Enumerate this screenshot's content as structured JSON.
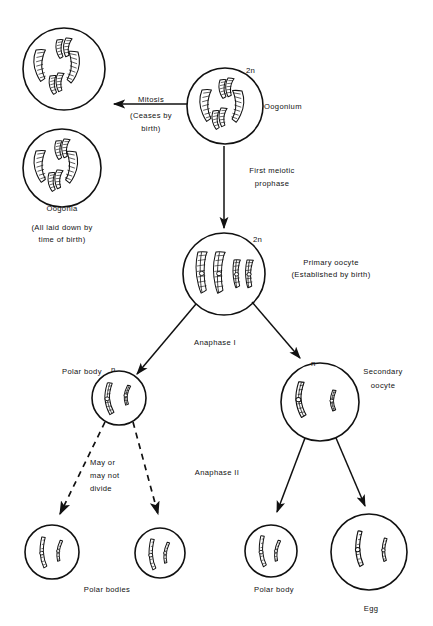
{
  "figure": {
    "background_color": "#ffffff",
    "ink_color": "#111111"
  },
  "labels": {
    "mitosis": "Mitosis",
    "ceases_by_birth": "(Ceases by",
    "ceases_by_birth_2": "birth)",
    "oogonia": "Oogonia",
    "all_laid_down": "(All laid down by",
    "all_laid_down_2": "time of birth)",
    "oogonium": "Oogonium",
    "first_meiotic": "First meiotic",
    "first_meiotic_2": "prophase",
    "primary_oocyte": "Primary oocyte",
    "primary_oocyte_2": "(Established by birth)",
    "anaphase_1": "Anaphase I",
    "anaphase_2": "Anaphase II",
    "polar_body_upper": "Polar body",
    "secondary_oocyte": "Secondary",
    "secondary_oocyte_2": "oocyte",
    "may_or": "May or",
    "may_not": "may not",
    "divide": "divide",
    "polar_bodies": "Polar bodies",
    "polar_body_lower": "Polar body",
    "egg": "Egg",
    "ploidy_2n_oogonium": "2n",
    "ploidy_2n_primary": "2n",
    "ploidy_n_polar": "n",
    "ploidy_n_secondary": "n"
  },
  "cells": [
    {
      "name": "oogonia-top",
      "cx": 64,
      "cy": 69,
      "r": 41,
      "ploidy": "2n",
      "chromosome_count": 6,
      "style": "duplicated-bivalent"
    },
    {
      "name": "oogonia-bottom",
      "cx": 62,
      "cy": 168,
      "r": 39,
      "ploidy": "2n",
      "chromosome_count": 6,
      "style": "duplicated-bivalent"
    },
    {
      "name": "oogonium",
      "cx": 225,
      "cy": 106,
      "r": 38,
      "ploidy": "2n",
      "chromosome_count": 6,
      "style": "duplicated-bivalent"
    },
    {
      "name": "primary-oocyte",
      "cx": 224,
      "cy": 274,
      "r": 41,
      "ploidy": "2n",
      "chromosome_count": 4,
      "style": "tetrad"
    },
    {
      "name": "polar-body-first",
      "cx": 119,
      "cy": 398,
      "r": 27,
      "ploidy": "n",
      "chromosome_count": 2,
      "style": "dyad"
    },
    {
      "name": "secondary-oocyte",
      "cx": 320,
      "cy": 402,
      "r": 39,
      "ploidy": "n",
      "chromosome_count": 2,
      "style": "dyad"
    },
    {
      "name": "polar-body-a",
      "cx": 52,
      "cy": 552,
      "r": 27,
      "ploidy": "",
      "chromosome_count": 2,
      "style": "monad"
    },
    {
      "name": "polar-body-b",
      "cx": 160,
      "cy": 553,
      "r": 25,
      "ploidy": "",
      "chromosome_count": 2,
      "style": "monad"
    },
    {
      "name": "polar-body-c",
      "cx": 271,
      "cy": 551,
      "r": 26,
      "ploidy": "",
      "chromosome_count": 2,
      "style": "monad"
    },
    {
      "name": "egg",
      "cx": 369,
      "cy": 552,
      "r": 38,
      "ploidy": "",
      "chromosome_count": 2,
      "style": "monad"
    }
  ],
  "arrows": [
    {
      "name": "mitosis-arrow",
      "from": "oogonium",
      "to": "oogonia-top",
      "style": "solid"
    },
    {
      "name": "first-meiotic-arrow",
      "from": "oogonium",
      "to": "primary-oocyte",
      "style": "solid"
    },
    {
      "name": "anaphase1-left-arrow",
      "from": "primary-oocyte",
      "to": "polar-body-first",
      "style": "solid"
    },
    {
      "name": "anaphase1-right-arrow",
      "from": "primary-oocyte",
      "to": "secondary-oocyte",
      "style": "solid"
    },
    {
      "name": "polar-divide-left-arrow",
      "from": "polar-body-first",
      "to": "polar-body-a",
      "style": "dashed"
    },
    {
      "name": "polar-divide-right-arrow",
      "from": "polar-body-first",
      "to": "polar-body-b",
      "style": "dashed"
    },
    {
      "name": "anaphase2-left-arrow",
      "from": "secondary-oocyte",
      "to": "polar-body-c",
      "style": "solid"
    },
    {
      "name": "anaphase2-right-arrow",
      "from": "secondary-oocyte",
      "to": "egg",
      "style": "solid"
    }
  ]
}
